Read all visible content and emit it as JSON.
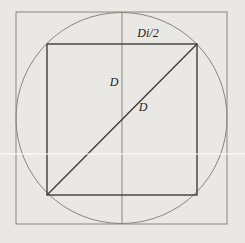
{
  "diagram": {
    "type": "geometry-figure",
    "background_color": "#e9e8e4",
    "thin_line_color": "#87867f",
    "thick_line_color": "#3f3f3a",
    "text_color": "#1b1b1b",
    "artifact_color": "#ffffff",
    "labels": {
      "half_side": "Di/2",
      "vertical_diameter": "D",
      "diagonal": "D"
    },
    "geometry": {
      "outer_square": {
        "x": 16,
        "y": 12,
        "width": 211,
        "height": 212
      },
      "circle": {
        "cx": 121.5,
        "cy": 118,
        "r": 105.5
      },
      "inner_square": {
        "x": 47,
        "y": 44,
        "width": 150,
        "height": 151
      },
      "vertical_line": {
        "x1": 122,
        "y1": 12,
        "x2": 122,
        "y2": 224
      },
      "diagonal_line": {
        "x1": 47,
        "y1": 195,
        "x2": 197,
        "y2": 44
      },
      "label_positions": {
        "half_side": {
          "x": 148,
          "y": 37
        },
        "vertical_diameter": {
          "x": 114,
          "y": 86
        },
        "diagonal": {
          "x": 143,
          "y": 111
        }
      },
      "artifact_line": {
        "x1": 0,
        "y1": 154,
        "x2": 245,
        "y2": 154
      }
    }
  }
}
